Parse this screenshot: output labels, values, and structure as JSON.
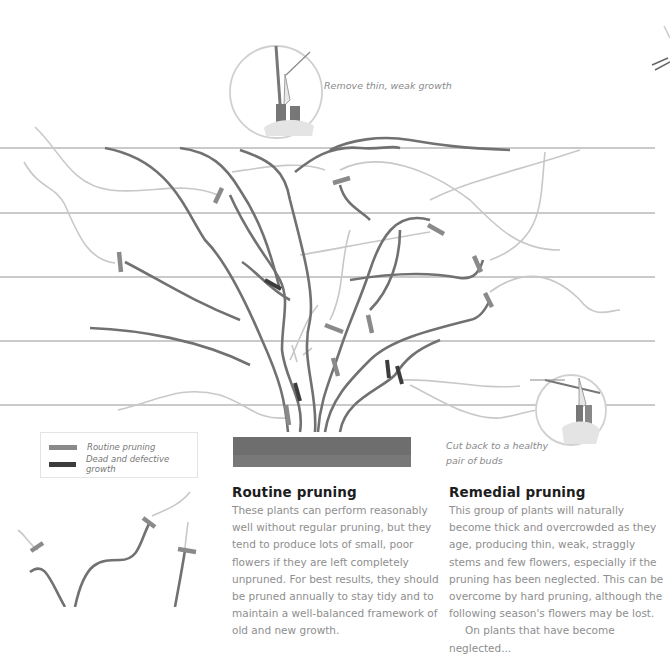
{
  "illustration": {
    "callout_top": "Remove thin, weak growth",
    "callout_right_line1": "Cut back to a healthy",
    "callout_right_line2": "pair of buds",
    "colors": {
      "trellis_wire": "#b4b4b4",
      "main_stem": "#6f6f6f",
      "young_growth": "#c4c4c4",
      "routine_cut": "#8a8a8a",
      "dead_cut": "#3c3c3c",
      "soil": "#6b6b6b"
    }
  },
  "legend": {
    "items": [
      {
        "label": "Routine pruning",
        "color": "#8a8a8a"
      },
      {
        "label": "Dead and defective growth",
        "color": "#3c3c3c"
      }
    ]
  },
  "routine": {
    "title": "Routine pruning",
    "body": "These plants can perform reasonably well without regular pruning, but they tend to produce lots of small, poor flowers if they are left completely unpruned. For best results, they should be pruned annually to stay tidy and to maintain a well-balanced framework of old and new growth."
  },
  "remedial": {
    "title": "Remedial pruning",
    "body": "This group of plants will naturally become thick and overcrowded as they age, producing thin, weak, straggly stems and few flowers, especially if the pruning has been neglected. This can be overcome by hard pruning, although the following season's flowers may be lost.",
    "body_cont": "On plants that have become neglected..."
  }
}
